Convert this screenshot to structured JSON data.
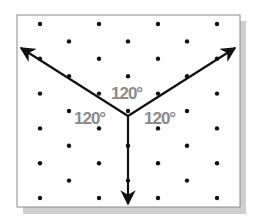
{
  "diagram": {
    "type": "isometric dot grid with three rays",
    "frame": {
      "left": 17,
      "top": 15,
      "right": 240,
      "bottom": 207,
      "border_color": "#888888",
      "shadow_color": "#c8c8c8"
    },
    "center": {
      "x": 128,
      "y": 116
    },
    "rays": [
      {
        "name": "left-ray",
        "tip": {
          "x": 19,
          "y": 47
        }
      },
      {
        "name": "right-ray",
        "tip": {
          "x": 237,
          "y": 47
        }
      },
      {
        "name": "down-ray",
        "tip": {
          "x": 128,
          "y": 206
        }
      }
    ],
    "angle_labels": [
      {
        "text": "120°",
        "x": 113,
        "y": 98
      },
      {
        "text": "120°",
        "x": 73,
        "y": 123
      },
      {
        "text": "120°",
        "x": 145,
        "y": 123
      }
    ],
    "colors": {
      "ray": "#111111",
      "dot": "#111111",
      "label": "#8a8a8a"
    }
  }
}
